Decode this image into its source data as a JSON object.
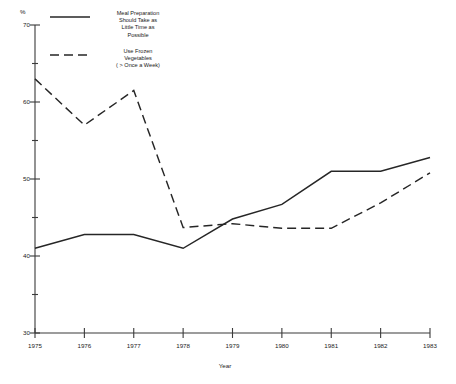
{
  "chart_data": {
    "type": "line",
    "title": "",
    "subtitle": "",
    "xlabel": "Year",
    "ylabel": "%",
    "x": [
      1975,
      1976,
      1977,
      1978,
      1979,
      1980,
      1981,
      1982,
      1983
    ],
    "categories": [
      "1975",
      "1976",
      "1977",
      "1978",
      "1979",
      "1980",
      "1981",
      "1982",
      "1983"
    ],
    "ylim": [
      30,
      70
    ],
    "xlim": [
      1975,
      1983
    ],
    "grid": false,
    "legend_position": "top-left",
    "y_major_ticks": [
      30,
      40,
      50,
      60,
      70
    ],
    "y_major_tick_labels": [
      "30",
      "40",
      "50",
      "60",
      "70"
    ],
    "y_minor_ticks": [
      35,
      45,
      55,
      65
    ],
    "series": [
      {
        "name": "Meal Preparation Should Take as Little Time as Possible",
        "style": "solid",
        "values": [
          41.0,
          42.8,
          42.8,
          41.0,
          44.8,
          46.7,
          51.0,
          51.0,
          52.8
        ]
      },
      {
        "name": "Use Frozen Vegetables ( > Once a Week)",
        "style": "dashed",
        "values": [
          63.0,
          57.0,
          61.5,
          43.7,
          44.2,
          43.6,
          43.6,
          46.9,
          50.8
        ]
      }
    ]
  },
  "legend": {
    "entries": [
      {
        "label": "Meal Preparation\nShould Take as\nLittle Time as\nPossible",
        "style": "solid"
      },
      {
        "label": "Use Frozen\nVegetables\n( > Once a Week)",
        "style": "dashed"
      }
    ]
  },
  "axes": {
    "y_unit": "%",
    "x_title": "Year"
  }
}
